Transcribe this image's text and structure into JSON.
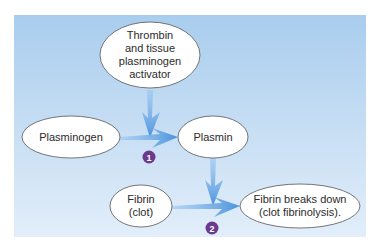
{
  "diagram": {
    "colors": {
      "background_top": "#a9cdee",
      "background_bottom": "#e2eefa",
      "arrow": "#5a9fe0",
      "badge": "#6b3a8c",
      "node_fill": "#ffffff",
      "node_stroke": "#555555"
    },
    "nodes": [
      {
        "id": "activator",
        "lines": [
          "Thrombin",
          "and tissue",
          "plasminogen",
          "activator"
        ]
      },
      {
        "id": "plasminogen",
        "lines": [
          "Plasminogen"
        ]
      },
      {
        "id": "plasmin",
        "lines": [
          "Plasmin"
        ]
      },
      {
        "id": "fibrin",
        "lines": [
          "Fibrin",
          "(clot)"
        ]
      },
      {
        "id": "fibrinolysis",
        "lines": [
          "Fibrin breaks down",
          "(clot fibrinolysis)."
        ]
      }
    ],
    "steps": [
      {
        "number": "1",
        "from": "plasminogen",
        "to": "plasmin",
        "catalyst": "activator"
      },
      {
        "number": "2",
        "from": "fibrin",
        "to": "fibrinolysis",
        "catalyst": "plasmin"
      }
    ]
  }
}
